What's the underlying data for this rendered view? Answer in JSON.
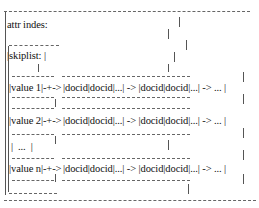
{
  "diagram": {
    "title_label": "attr indes:",
    "skiplist_label": "|skiplist: |",
    "rows": [
      {
        "value": "|value 1|-+->",
        "chain": "|docid|docid|...| -> |docid|docid|...| -> ... |"
      },
      {
        "value": "|value 2|-+->",
        "chain": "|docid|docid|...| -> |docid|docid|...| -> ... |"
      },
      {
        "value": "|  ...  |",
        "chain": ""
      },
      {
        "value": "|value n|-+->",
        "chain": "|docid|docid|...| -> |docid|docid|...| -> ... |"
      }
    ],
    "box_border": "+---------+",
    "chain_border": "+-----+-----+---+   +-----+-----+---+-----+",
    "outer_border": "+----------------------------------------------------------------------+"
  }
}
